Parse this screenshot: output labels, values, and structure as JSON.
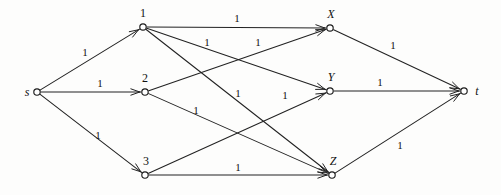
{
  "figure": {
    "width": 501,
    "height": 195,
    "background_color": "#fdfdfc",
    "ink_color": "#222222"
  },
  "nodes": [
    {
      "id": "s",
      "label": "s",
      "x": 37,
      "y": 92,
      "label_x": 27,
      "label_y": 92,
      "italic": true,
      "radius": 3.2
    },
    {
      "id": "n1",
      "label": "1",
      "x": 143,
      "y": 27,
      "label_x": 143,
      "label_y": 13,
      "italic": false,
      "radius": 3.2
    },
    {
      "id": "n2",
      "label": "2",
      "x": 145,
      "y": 92,
      "label_x": 145,
      "label_y": 78,
      "italic": false,
      "radius": 3.2
    },
    {
      "id": "n3",
      "label": "3",
      "x": 145,
      "y": 175,
      "label_x": 146,
      "label_y": 161,
      "italic": false,
      "radius": 3.2
    },
    {
      "id": "X",
      "label": "X",
      "x": 330,
      "y": 28,
      "label_x": 331,
      "label_y": 14,
      "italic": true,
      "radius": 3.2
    },
    {
      "id": "Y",
      "label": "Y",
      "x": 330,
      "y": 91,
      "label_x": 331,
      "label_y": 77,
      "italic": true,
      "radius": 3.2
    },
    {
      "id": "Z",
      "label": "Z",
      "x": 332,
      "y": 175,
      "label_x": 333,
      "label_y": 161,
      "italic": true,
      "radius": 3.2
    },
    {
      "id": "t",
      "label": "t",
      "x": 464,
      "y": 91,
      "label_x": 477,
      "label_y": 91,
      "italic": true,
      "radius": 3.2
    }
  ],
  "edges": [
    {
      "id": "s-1",
      "from": "s",
      "to": "n1",
      "capacity": "1",
      "label_x": 85,
      "label_y": 52
    },
    {
      "id": "s-2",
      "from": "s",
      "to": "n2",
      "capacity": "1",
      "label_x": 100,
      "label_y": 83
    },
    {
      "id": "s-3",
      "from": "s",
      "to": "n3",
      "capacity": "1",
      "label_x": 98,
      "label_y": 135
    },
    {
      "id": "1-X",
      "from": "n1",
      "to": "X",
      "capacity": "1",
      "label_x": 237,
      "label_y": 18
    },
    {
      "id": "1-Y",
      "from": "n1",
      "to": "Y",
      "capacity": "1",
      "label_x": 207,
      "label_y": 42
    },
    {
      "id": "1-Z",
      "from": "n1",
      "to": "Z",
      "capacity": "1",
      "label_x": 238,
      "label_y": 93
    },
    {
      "id": "2-X",
      "from": "n2",
      "to": "X",
      "capacity": "1",
      "label_x": 258,
      "label_y": 42
    },
    {
      "id": "2-Z",
      "from": "n2",
      "to": "Z",
      "capacity": "1",
      "label_x": 196,
      "label_y": 110
    },
    {
      "id": "3-Y",
      "from": "n3",
      "to": "Y",
      "capacity": "1",
      "label_x": 285,
      "label_y": 95
    },
    {
      "id": "3-Z",
      "from": "n3",
      "to": "Z",
      "capacity": "1",
      "label_x": 238,
      "label_y": 167
    },
    {
      "id": "X-t",
      "from": "X",
      "to": "t",
      "capacity": "1",
      "label_x": 393,
      "label_y": 45
    },
    {
      "id": "Y-t",
      "from": "Y",
      "to": "t",
      "capacity": "1",
      "label_x": 380,
      "label_y": 82
    },
    {
      "id": "Z-t",
      "from": "Z",
      "to": "t",
      "capacity": "1",
      "label_x": 400,
      "label_y": 145
    }
  ]
}
